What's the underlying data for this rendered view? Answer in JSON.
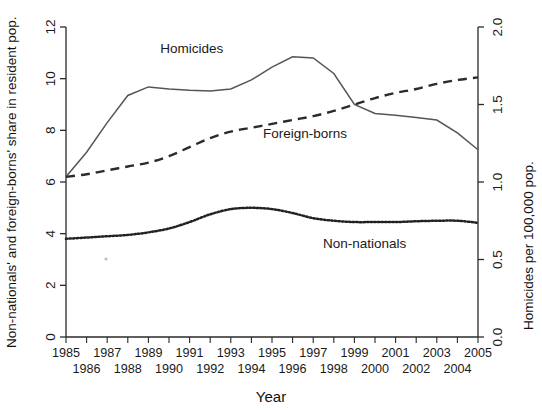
{
  "figure": {
    "background": "#ffffff",
    "ink": "#1a1a1a"
  },
  "axes": {
    "left_title": "Non-nationals' and foreign-borns' share in resident pop.",
    "right_title": "Homicides per 100,000 pop.",
    "x_title": "Year",
    "left_ticks": [
      "0",
      "2",
      "4",
      "6",
      "8",
      "10",
      "12"
    ],
    "right_ticks": [
      "0.0",
      "0.5",
      "1.0",
      "1.5",
      "2.0"
    ],
    "x_ticks_upper": [
      "1985",
      "1987",
      "1989",
      "1991",
      "1993",
      "1995",
      "1997",
      "1999",
      "2001",
      "2003",
      "2005"
    ],
    "x_ticks_lower": [
      "1986",
      "1988",
      "1990",
      "1992",
      "1994",
      "1996",
      "1998",
      "2000",
      "2002",
      "2004"
    ]
  },
  "series_labels": {
    "homicides": "Homicides",
    "foreign_borns": "Foreign-borns",
    "non_nationals": "Non-nationals"
  },
  "chart_data": {
    "type": "line",
    "title": "",
    "subtitle": "",
    "xlabel": "Year",
    "ylabel": "Non-nationals' and foreign-borns' share in resident pop.",
    "y2label": "Homicides per 100,000 pop.",
    "xlim": [
      1985,
      2005
    ],
    "ylim": [
      0,
      12
    ],
    "y2lim": [
      0.0,
      2.0
    ],
    "grid": false,
    "legend_position": "inline-annotations",
    "x": [
      1985,
      1986,
      1987,
      1988,
      1989,
      1990,
      1991,
      1992,
      1993,
      1994,
      1995,
      1996,
      1997,
      1998,
      1999,
      2000,
      2001,
      2002,
      2003,
      2004,
      2005
    ],
    "series": [
      {
        "name": "Homicides",
        "axis": "right",
        "units": "homicides per 100,000 pop.",
        "linestyle": "solid",
        "color": "#555555",
        "values": [
          1.03,
          1.19,
          1.38,
          1.56,
          1.61,
          1.6,
          1.59,
          1.59,
          1.6,
          1.66,
          1.74,
          1.81,
          1.8,
          1.7,
          1.5,
          1.44,
          1.43,
          1.42,
          1.4,
          1.32,
          1.21
        ],
        "values_left_scale": [
          6.2,
          7.15,
          8.3,
          9.35,
          9.68,
          9.6,
          9.55,
          9.52,
          9.6,
          9.95,
          10.45,
          10.85,
          10.8,
          10.2,
          9.0,
          8.65,
          8.58,
          8.5,
          8.4,
          7.9,
          7.25
        ]
      },
      {
        "name": "Foreign-borns",
        "axis": "left",
        "units": "share in resident pop. (%)",
        "linestyle": "dashed",
        "color": "#2b2b2b",
        "values": [
          6.2,
          6.3,
          6.45,
          6.6,
          6.75,
          7.0,
          7.35,
          7.7,
          7.95,
          8.1,
          8.25,
          8.4,
          8.55,
          8.75,
          9.0,
          9.25,
          9.45,
          9.6,
          9.8,
          9.95,
          10.05
        ]
      },
      {
        "name": "Non-nationals",
        "axis": "left",
        "units": "share in resident pop. (%)",
        "linestyle": "dotted",
        "color": "#222222",
        "values": [
          3.8,
          3.85,
          3.9,
          3.95,
          4.05,
          4.2,
          4.45,
          4.75,
          4.95,
          5.0,
          4.95,
          4.8,
          4.6,
          4.5,
          4.45,
          4.45,
          4.45,
          4.48,
          4.5,
          4.5,
          4.42
        ]
      }
    ],
    "annotations": [
      {
        "text": "Homicides",
        "x": 1991.1,
        "y_left": 11.0
      },
      {
        "text": "Foreign-borns",
        "x": 1996.6,
        "y_left": 7.7
      },
      {
        "text": "Non-nationals",
        "x": 1999.5,
        "y_left": 3.45
      }
    ]
  }
}
